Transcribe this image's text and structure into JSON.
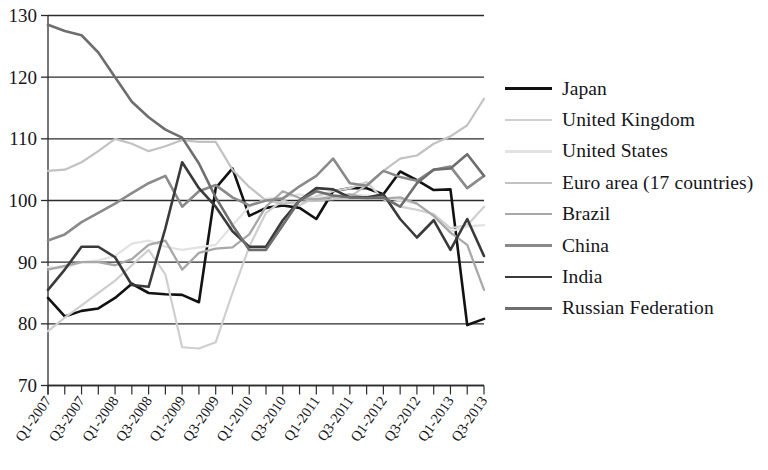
{
  "chart_data": {
    "type": "line",
    "title": "",
    "subtitle": "",
    "xlabel": "",
    "ylabel": "",
    "ylim": [
      70,
      130
    ],
    "ytick_labels": [
      "70",
      "80",
      "90",
      "100",
      "110",
      "120",
      "130"
    ],
    "ytick_values": [
      70,
      80,
      90,
      100,
      110,
      120,
      130
    ],
    "grid": true,
    "legend_position": "right",
    "x": [
      "Q1-2007",
      "Q2-2007",
      "Q3-2007",
      "Q4-2007",
      "Q1-2008",
      "Q2-2008",
      "Q3-2008",
      "Q4-2008",
      "Q1-2009",
      "Q2-2009",
      "Q3-2009",
      "Q4-2009",
      "Q1-2010",
      "Q2-2010",
      "Q3-2010",
      "Q4-2010",
      "Q1-2011",
      "Q2-2011",
      "Q3-2011",
      "Q4-2011",
      "Q1-2012",
      "Q2-2012",
      "Q3-2012",
      "Q4-2012",
      "Q1-2013",
      "Q2-2013",
      "Q3-2013"
    ],
    "xtick_labels": [
      "Q1-2007",
      "",
      "Q3-2007",
      "",
      "Q1-2008",
      "",
      "Q3-2008",
      "",
      "Q1-2009",
      "",
      "Q3-2009",
      "",
      "Q1-2010",
      "",
      "Q3-2010",
      "",
      "Q1-2011",
      "",
      "Q3-2011",
      "",
      "Q1-2012",
      "",
      "Q3-2012",
      "",
      "Q1-2013",
      "",
      "Q3-2013"
    ],
    "series": [
      {
        "name": "Japan",
        "color": "#121212",
        "width": 2.6,
        "values": [
          84.2,
          81.2,
          82.1,
          82.5,
          84.2,
          86.5,
          85.0,
          84.8,
          84.7,
          83.5,
          102.0,
          105.2,
          97.5,
          98.8,
          99.2,
          98.8,
          97.0,
          101.5,
          102.0,
          102.0,
          101.0,
          104.7,
          103.3,
          101.7,
          101.8,
          79.8,
          80.8
        ]
      },
      {
        "name": "United Kingdom",
        "color": "#cfcfcf",
        "width": 2.2,
        "values": [
          78.8,
          81.0,
          83.0,
          85.0,
          87.0,
          89.5,
          92.0,
          88.0,
          76.2,
          76.0,
          77.0,
          85.0,
          92.5,
          98.0,
          100.0,
          99.2,
          100.7,
          101.5,
          102.0,
          103.0,
          100.2,
          99.0,
          98.5,
          97.8,
          95.5,
          96.0,
          99.0
        ]
      },
      {
        "name": "United States",
        "color": "#e2e2e2",
        "width": 2.2,
        "values": [
          89.2,
          89.0,
          90.0,
          90.3,
          91.0,
          93.0,
          93.5,
          92.5,
          92.0,
          92.4,
          92.8,
          96.0,
          99.0,
          100.3,
          100.5,
          101.0,
          100.4,
          100.8,
          101.0,
          100.8,
          100.5,
          100.0,
          99.5,
          97.5,
          95.0,
          95.8,
          96.0
        ]
      },
      {
        "name": "Euro area (17 countries)",
        "color": "#c2c2c2",
        "width": 2.2,
        "values": [
          104.8,
          105.0,
          106.2,
          108.0,
          110.0,
          109.2,
          108.0,
          108.8,
          109.8,
          109.5,
          109.5,
          105.0,
          102.2,
          100.0,
          99.5,
          99.8,
          100.0,
          100.2,
          100.6,
          102.5,
          104.8,
          106.8,
          107.3,
          109.2,
          110.4,
          112.2,
          116.5
        ]
      },
      {
        "name": "Brazil",
        "color": "#a8a8a8",
        "width": 2.3,
        "values": [
          88.8,
          89.4,
          90.0,
          90.0,
          89.5,
          90.5,
          92.8,
          93.5,
          88.8,
          91.5,
          92.2,
          92.4,
          94.5,
          99.0,
          101.5,
          100.4,
          100.2,
          100.6,
          101.0,
          100.4,
          100.3,
          100.5,
          99.5,
          97.5,
          94.8,
          92.8,
          85.5
        ]
      },
      {
        "name": "China",
        "color": "#8a8a8a",
        "width": 2.6,
        "values": [
          93.5,
          94.5,
          96.5,
          98.0,
          99.5,
          101.2,
          102.8,
          104.0,
          99.0,
          101.5,
          102.5,
          100.5,
          99.2,
          100.0,
          100.3,
          102.3,
          104.0,
          106.8,
          102.8,
          102.4,
          104.8,
          103.8,
          103.2,
          105.0,
          105.5,
          102.0,
          104.0
        ]
      },
      {
        "name": "India",
        "color": "#3a3a3a",
        "width": 2.6,
        "values": [
          85.5,
          88.8,
          92.5,
          92.5,
          90.8,
          86.3,
          86.0,
          95.5,
          106.2,
          102.0,
          99.0,
          95.0,
          92.5,
          92.5,
          96.8,
          100.0,
          102.0,
          101.8,
          100.5,
          100.5,
          101.0,
          97.0,
          94.0,
          96.8,
          92.0,
          97.0,
          91.0
        ]
      },
      {
        "name": "Russian Federation",
        "color": "#6e6e6e",
        "width": 2.6,
        "values": [
          128.5,
          127.5,
          126.8,
          124.0,
          120.0,
          116.0,
          113.5,
          111.5,
          110.2,
          106.0,
          100.5,
          96.0,
          92.0,
          92.0,
          96.0,
          100.0,
          101.5,
          100.8,
          100.5,
          100.4,
          100.5,
          99.0,
          102.8,
          105.0,
          105.2,
          107.5,
          104.0
        ]
      }
    ]
  },
  "axis": {
    "y_min_label": "70",
    "y_max_label": "130"
  }
}
